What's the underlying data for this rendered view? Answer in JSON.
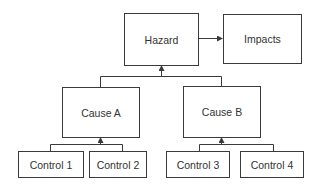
{
  "diagram": {
    "type": "hazard-cause-control tree",
    "nodes": {
      "hazard": "Hazard",
      "impacts": "Impacts",
      "cause_a": "Cause A",
      "cause_b": "Cause B",
      "control_1": "Control 1",
      "control_2": "Control 2",
      "control_3": "Control 3",
      "control_4": "Control 4"
    },
    "edges": [
      {
        "from": "Hazard",
        "to": "Impacts"
      },
      {
        "from": "Cause A",
        "to": "Hazard"
      },
      {
        "from": "Cause B",
        "to": "Hazard"
      },
      {
        "from": "Control 1",
        "to": "Cause A"
      },
      {
        "from": "Control 2",
        "to": "Cause A"
      },
      {
        "from": "Control 3",
        "to": "Cause B"
      },
      {
        "from": "Control 4",
        "to": "Cause B"
      }
    ],
    "colors": {
      "line": "#3a3a3a",
      "text": "#333333",
      "background": "#ffffff"
    }
  }
}
